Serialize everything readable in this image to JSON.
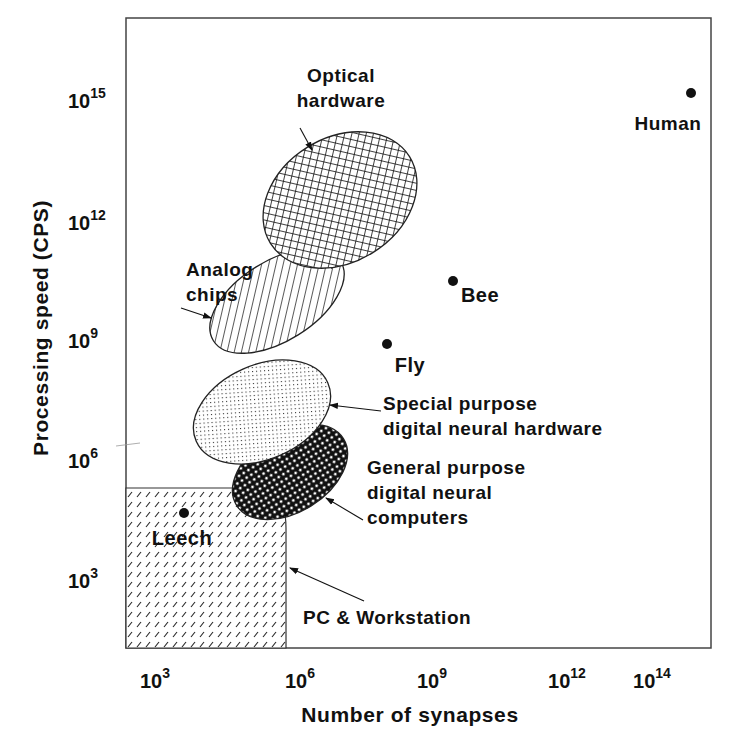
{
  "chart_data": {
    "type": "scatter",
    "title": "",
    "xlabel": "Number of synapses",
    "ylabel": "Processing speed (CPS)",
    "x_scale": "log",
    "y_scale": "log",
    "xlim_exp": [
      2,
      14.7
    ],
    "ylim_exp": [
      0,
      16.8
    ],
    "grid": false,
    "legend": "none (inline annotations)",
    "x_ticks": [
      {
        "base": "10",
        "exp": "3",
        "px": 163
      },
      {
        "base": "10",
        "exp": "6",
        "px": 308
      },
      {
        "base": "10",
        "exp": "9",
        "px": 440
      },
      {
        "base": "10",
        "exp": "12",
        "px": 575
      },
      {
        "base": "10",
        "exp": "14",
        "px": 660
      }
    ],
    "y_ticks": [
      {
        "base": "10",
        "exp": "15",
        "px": 100
      },
      {
        "base": "10",
        "exp": "12",
        "px": 222
      },
      {
        "base": "10",
        "exp": "9",
        "px": 340
      },
      {
        "base": "10",
        "exp": "6",
        "px": 460
      },
      {
        "base": "10",
        "exp": "3",
        "px": 580
      }
    ],
    "points": [
      {
        "name": "Human",
        "synapses_exp": 14,
        "cps_exp": 15.2,
        "px": [
          691,
          93
        ],
        "label_px": [
          668,
          130
        ]
      },
      {
        "name": "Bee",
        "synapses_exp": 9,
        "cps_exp": 10.5,
        "px": [
          453,
          281
        ],
        "label_px": [
          480,
          302
        ]
      },
      {
        "name": "Fly",
        "synapses_exp": 7.5,
        "cps_exp": 9,
        "px": [
          387,
          344
        ],
        "label_px": [
          410,
          372
        ]
      },
      {
        "name": "Leech",
        "synapses_exp": 3.5,
        "cps_exp": 4.5,
        "px": [
          184,
          513
        ],
        "label_px": [
          182,
          545
        ]
      }
    ],
    "regions": [
      {
        "name": "Optical hardware",
        "pattern": "crosshatch",
        "synapses_exp_range": [
          5,
          9
        ],
        "cps_exp_range": [
          9.5,
          14
        ],
        "ellipse": {
          "cx": 340,
          "cy": 200,
          "rx": 82,
          "ry": 62,
          "rot": -32
        },
        "label_lines": [
          "Optical",
          "hardware"
        ],
        "label_px": [
          341,
          82
        ],
        "arrow": [
          [
            300,
            128
          ],
          [
            312,
            150
          ]
        ]
      },
      {
        "name": "Analog chips",
        "pattern": "diagonal-lines",
        "synapses_exp_range": [
          4,
          7.5
        ],
        "cps_exp_range": [
          8.5,
          11
        ],
        "ellipse": {
          "cx": 277,
          "cy": 301,
          "rx": 75,
          "ry": 40,
          "rot": -32
        },
        "label_lines": [
          "Analog",
          "chips"
        ],
        "label_px": [
          186,
          276
        ],
        "arrow": [
          [
            181,
            308
          ],
          [
            211,
            318
          ]
        ]
      },
      {
        "name": "Special purpose digital neural hardware",
        "pattern": "fine-dots",
        "synapses_exp_range": [
          3.5,
          7.5
        ],
        "cps_exp_range": [
          5.5,
          8.5
        ],
        "ellipse": {
          "cx": 262,
          "cy": 412,
          "rx": 72,
          "ry": 47,
          "rot": -24
        },
        "label_lines": [
          "Special purpose",
          "digital neural hardware"
        ],
        "label_px": [
          383,
          410
        ],
        "arrow": [
          [
            381,
            411
          ],
          [
            330,
            405
          ]
        ]
      },
      {
        "name": "General purpose digital neural computers",
        "pattern": "dark-dots",
        "synapses_exp_range": [
          4,
          7.5
        ],
        "cps_exp_range": [
          4.5,
          7
        ],
        "ellipse": {
          "cx": 290,
          "cy": 472,
          "rx": 63,
          "ry": 40,
          "rot": -32
        },
        "label_lines": [
          "General purpose",
          "digital neural",
          "computers"
        ],
        "label_px": [
          367,
          474
        ],
        "arrow": [
          [
            363,
            520
          ],
          [
            326,
            498
          ]
        ]
      },
      {
        "name": "PC & Workstation",
        "pattern": "short-dashes",
        "synapses_exp_range": [
          2,
          5.8
        ],
        "cps_exp_range": [
          0,
          5
        ],
        "rect": {
          "x1": 126,
          "y1": 488,
          "x2": 286,
          "y2": 648,
          "corner": 30
        },
        "label_lines": [
          "PC & Workstation"
        ],
        "label_px": [
          303,
          624
        ],
        "arrow": [
          [
            364,
            601
          ],
          [
            290,
            568
          ]
        ]
      }
    ],
    "frame_px": {
      "left": 126,
      "top": 18,
      "right": 711,
      "bottom": 648
    }
  }
}
